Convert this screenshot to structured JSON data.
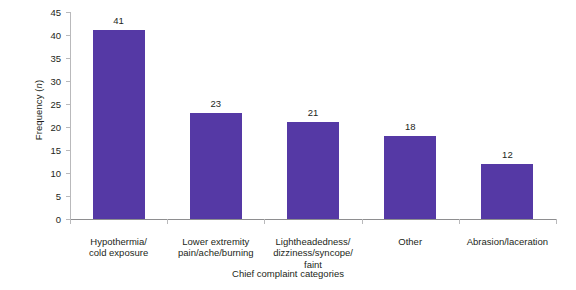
{
  "chart_data": {
    "type": "bar",
    "title": "",
    "subtitle": "",
    "xlabel": "Chief complaint categories",
    "ylabel": "Frequency (n)",
    "ylabel_prefix": "Frequency (",
    "ylabel_italic": "n",
    "ylabel_suffix": ")",
    "categories": [
      "Hypothermia/\ncold exposure",
      "Lower extremity\npain/ache/burning",
      "Lightheadedness/\ndizziness/syncope/\nfaint",
      "Other",
      "Abrasion/laceration"
    ],
    "values": [
      41,
      23,
      21,
      18,
      12
    ],
    "data_labels": [
      "41",
      "23",
      "21",
      "18",
      "12"
    ],
    "ylim": [
      0,
      45
    ],
    "ytick_step": 5,
    "ytick_labels": [
      "0",
      "5",
      "10",
      "15",
      "20",
      "25",
      "30",
      "35",
      "40",
      "45"
    ],
    "grid": false,
    "legend": false,
    "legend_position": "none",
    "bar_color": "#5539a5",
    "axis_color": "#b9b9bb",
    "text_color": "#231f20"
  }
}
